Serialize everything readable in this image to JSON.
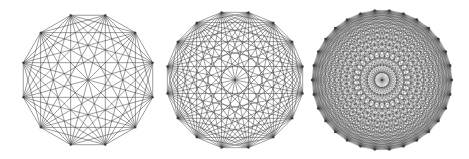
{
  "figure": {
    "width": 469,
    "height": 159,
    "background": "#ffffff",
    "edge_color": "#3a3a3a",
    "graphs": [
      {
        "name": "complete-graph-k12",
        "label": "K12",
        "vertices": 12,
        "cx": 88,
        "cy": 80,
        "r": 67,
        "edge_width": 0.6,
        "edge_opacity": 0.85
      },
      {
        "name": "complete-graph-k16",
        "label": "K16",
        "vertices": 16,
        "cx": 235,
        "cy": 80,
        "r": 69,
        "edge_width": 0.55,
        "edge_opacity": 0.9
      },
      {
        "name": "complete-graph-k30",
        "label": "K30",
        "vertices": 30,
        "cx": 382,
        "cy": 80,
        "r": 70,
        "edge_width": 0.4,
        "edge_opacity": 0.75
      }
    ]
  }
}
